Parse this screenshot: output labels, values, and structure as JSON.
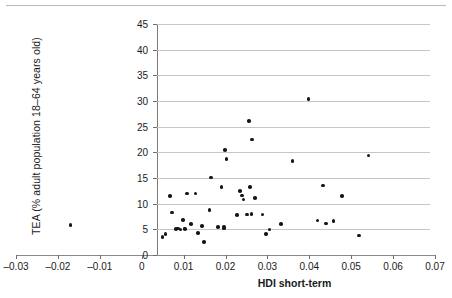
{
  "chart_data": {
    "type": "scatter",
    "title": "",
    "xlabel": "HDI short-term",
    "ylabel": "TEA (% adult population 18–64 years old)",
    "xlim": [
      -0.03,
      0.07
    ],
    "ylim": [
      0,
      45
    ],
    "xticks": [
      -0.03,
      -0.02,
      -0.01,
      0,
      0.01,
      0.02,
      0.03,
      0.04,
      0.05,
      0.06,
      0.07
    ],
    "xtick_labels": [
      "–0.03",
      "–0.02",
      "–0.01",
      "0",
      "0.01",
      "0.02",
      "0.03",
      "0.04",
      "0.05",
      "0.06",
      "0.07"
    ],
    "yticks": [
      0,
      5,
      10,
      15,
      20,
      25,
      30,
      35,
      40,
      45
    ],
    "ytick_labels": [
      "0",
      "5",
      "10",
      "15",
      "20",
      "25",
      "30",
      "35",
      "40",
      "45"
    ],
    "grid": "horizontal",
    "legend": null,
    "marker_color": "#15151a",
    "grid_color": "#c6c6c6",
    "axis_color": "#7b7b7b",
    "points": [
      {
        "x": -0.017,
        "y": 5.9
      },
      {
        "x": 0.005,
        "y": 3.5
      },
      {
        "x": 0.0057,
        "y": 4.1
      },
      {
        "x": 0.0067,
        "y": 11.5
      },
      {
        "x": 0.0072,
        "y": 8.3
      },
      {
        "x": 0.0082,
        "y": 5.1
      },
      {
        "x": 0.0086,
        "y": 5.2
      },
      {
        "x": 0.0093,
        "y": 5.0
      },
      {
        "x": 0.0098,
        "y": 6.8
      },
      {
        "x": 0.0102,
        "y": 5.2
      },
      {
        "x": 0.0104,
        "y": 5.1
      },
      {
        "x": 0.0108,
        "y": 12.0
      },
      {
        "x": 0.0118,
        "y": 6.0
      },
      {
        "x": 0.0128,
        "y": 12.0
      },
      {
        "x": 0.0135,
        "y": 4.3
      },
      {
        "x": 0.0144,
        "y": 5.6
      },
      {
        "x": 0.0148,
        "y": 2.5
      },
      {
        "x": 0.0162,
        "y": 8.8
      },
      {
        "x": 0.0166,
        "y": 15.1
      },
      {
        "x": 0.0182,
        "y": 5.4
      },
      {
        "x": 0.019,
        "y": 13.3
      },
      {
        "x": 0.0196,
        "y": 5.5
      },
      {
        "x": 0.0197,
        "y": 5.2
      },
      {
        "x": 0.0199,
        "y": 20.4
      },
      {
        "x": 0.0202,
        "y": 18.7
      },
      {
        "x": 0.0228,
        "y": 7.8
      },
      {
        "x": 0.0234,
        "y": 12.5
      },
      {
        "x": 0.024,
        "y": 11.6
      },
      {
        "x": 0.0243,
        "y": 10.8
      },
      {
        "x": 0.0251,
        "y": 7.9
      },
      {
        "x": 0.0256,
        "y": 26.1
      },
      {
        "x": 0.0258,
        "y": 13.2
      },
      {
        "x": 0.0262,
        "y": 8.0
      },
      {
        "x": 0.0263,
        "y": 22.5
      },
      {
        "x": 0.027,
        "y": 11.1
      },
      {
        "x": 0.0288,
        "y": 7.9
      },
      {
        "x": 0.0296,
        "y": 4.1
      },
      {
        "x": 0.0305,
        "y": 5.0
      },
      {
        "x": 0.0332,
        "y": 6.0
      },
      {
        "x": 0.036,
        "y": 18.3
      },
      {
        "x": 0.0398,
        "y": 30.4
      },
      {
        "x": 0.042,
        "y": 6.7
      },
      {
        "x": 0.0432,
        "y": 13.5
      },
      {
        "x": 0.044,
        "y": 6.1
      },
      {
        "x": 0.0458,
        "y": 6.6
      },
      {
        "x": 0.0478,
        "y": 11.5
      },
      {
        "x": 0.0519,
        "y": 3.8
      },
      {
        "x": 0.0541,
        "y": 19.4
      }
    ]
  }
}
